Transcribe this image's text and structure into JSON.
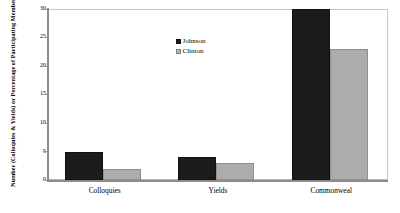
{
  "chart_data": {
    "type": "bar",
    "title": "",
    "subtitle": "",
    "xlabel": "",
    "ylabel": "Number (Colloquies & Yields) or Percentage of Participating Members who Mentioned Public Good (Commonweal)",
    "categories": [
      "Colloquies",
      "Yields",
      "Commonweal"
    ],
    "series": [
      {
        "name": "Johnson",
        "color": "#1c1c1c",
        "values": [
          5,
          4,
          30
        ]
      },
      {
        "name": "Clinton",
        "color": "#acacac",
        "values": [
          2,
          3,
          23
        ]
      }
    ],
    "ylim": [
      0,
      30
    ],
    "yticks": [
      0,
      5,
      10,
      15,
      20,
      25,
      30
    ],
    "ytick_labels": [
      "0",
      "5",
      "10",
      "15",
      "20",
      "25",
      "30"
    ],
    "grid": false,
    "legend_position": "upper-center"
  },
  "legend": {
    "entries": [
      {
        "label": "Johnson",
        "swatch": "johnson-swatch"
      },
      {
        "label": "Clinton",
        "swatch": "clinton-swatch"
      }
    ]
  },
  "axes": {
    "y_title": "Number (Colloquies & Yields) or Percentage of Participating Members who Mentioned Public Good (Commonweal)",
    "y_ticks": [
      "30",
      "25",
      "20",
      "15",
      "10",
      "5",
      "0"
    ],
    "x_ticks": [
      "Colloquies",
      "Yields",
      "Commonweal"
    ]
  }
}
